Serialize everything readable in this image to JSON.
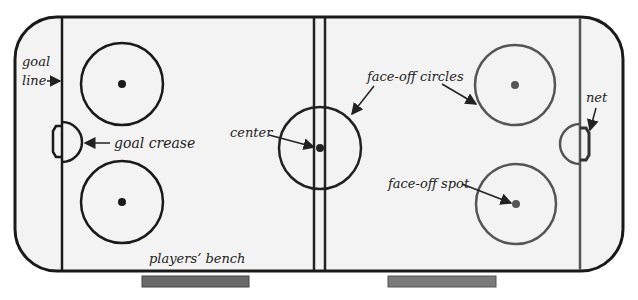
{
  "colors": {
    "left_lines": "#1a1a1a",
    "right_lines": "#555555",
    "ice": "#f3f3f3",
    "bench": "#6a6a6a"
  },
  "labels": {
    "goal_line_1": "goal",
    "goal_line_2": "line",
    "goal_crease": "goal crease",
    "center": "center",
    "face_off_circles": "face-off circles",
    "net": "net",
    "face_off_spot": "face-off spot",
    "players_bench": "players’ bench"
  }
}
